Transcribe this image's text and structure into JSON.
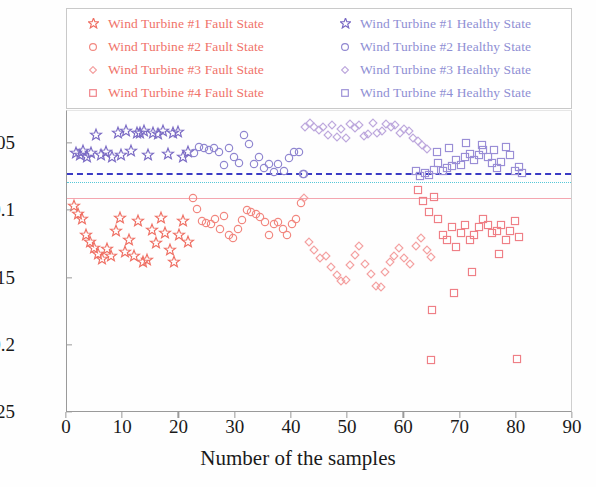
{
  "legend": {
    "entries": [
      {
        "label": "Wind Turbine #1  Fault State",
        "marker": "star",
        "color": "#ef6f63",
        "group": "fault"
      },
      {
        "label": "Wind Turbine #2  Fault State",
        "marker": "circle",
        "color": "#f2877f",
        "group": "fault"
      },
      {
        "label": "Wind Turbine #3  Fault State",
        "marker": "diamond",
        "color": "#f4a0a0",
        "group": "fault"
      },
      {
        "label": "Wind Turbine #4  Fault State",
        "marker": "square",
        "color": "#ef7f86",
        "group": "fault"
      },
      {
        "label": "Wind Turbine #1 Healthy State",
        "marker": "star",
        "color": "#7a6ac4",
        "group": "healthy"
      },
      {
        "label": "Wind Turbine #2 Healthy State",
        "marker": "circle",
        "color": "#8f86d0",
        "group": "healthy"
      },
      {
        "label": "Wind Turbine #3 Healthy State",
        "marker": "diamond",
        "color": "#bda8dd",
        "group": "healthy"
      },
      {
        "label": "Wind Turbine #4 Healthy State",
        "marker": "square",
        "color": "#9a8ed6",
        "group": "healthy"
      }
    ]
  },
  "chart_data": {
    "type": "scatter",
    "title": "",
    "xlabel": "Number of the samples",
    "ylabel": "",
    "xlim": [
      0,
      90
    ],
    "ylim": [
      -0.25,
      -0.0255
    ],
    "xticks": [
      0,
      10,
      20,
      30,
      40,
      50,
      60,
      70,
      80,
      90
    ],
    "xtick_labels": [
      "0",
      "10",
      "20",
      "30",
      "40",
      "50",
      "60",
      "70",
      "80",
      "90"
    ],
    "yticks": [
      -0.05,
      -0.1,
      -0.15,
      -0.2,
      -0.25
    ],
    "ytick_labels": [
      "-0.05",
      "-0.1",
      "-0.15",
      "-0.2",
      "-0.25"
    ],
    "grid": false,
    "legend_position": "top",
    "threshold_lines": [
      {
        "name": "blue-dashed-threshold",
        "y": -0.0718,
        "style": "dashed",
        "color": "#3b3bc4"
      },
      {
        "name": "cyan-dotted-threshold",
        "y": -0.0783,
        "style": "dotted",
        "color": "#55c8d8"
      },
      {
        "name": "pink-solid-threshold",
        "y": -0.0902,
        "style": "solid",
        "color": "#f4a6b0"
      }
    ],
    "series": [
      {
        "name": "Wind Turbine #1 Healthy State",
        "marker": "star",
        "color": "#7a6ac4",
        "points": [
          [
            1.6,
            -0.0565
          ],
          [
            2.3,
            -0.0585
          ],
          [
            2.9,
            -0.0555
          ],
          [
            3.6,
            -0.06
          ],
          [
            4.3,
            -0.0565
          ],
          [
            5.2,
            -0.043
          ],
          [
            6.1,
            -0.0585
          ],
          [
            7.0,
            -0.056
          ],
          [
            8.0,
            -0.06
          ],
          [
            9.0,
            -0.042
          ],
          [
            9.6,
            -0.0585
          ],
          [
            10.5,
            -0.04
          ],
          [
            11.3,
            -0.0555
          ],
          [
            12.4,
            -0.0415
          ],
          [
            13.0,
            -0.042
          ],
          [
            13.6,
            -0.0405
          ],
          [
            14.4,
            -0.0585
          ],
          [
            15.3,
            -0.0415
          ],
          [
            16.2,
            -0.0425
          ],
          [
            17.1,
            -0.0405
          ],
          [
            18.0,
            -0.0575
          ],
          [
            18.9,
            -0.042
          ],
          [
            19.8,
            -0.041
          ],
          [
            20.7,
            -0.06
          ],
          [
            21.6,
            -0.056
          ]
        ]
      },
      {
        "name": "Wind Turbine #1 Fault State",
        "marker": "star",
        "color": "#ef6f63",
        "points": [
          [
            1.2,
            -0.096
          ],
          [
            1.9,
            -0.102
          ],
          [
            2.6,
            -0.1055
          ],
          [
            3.3,
            -0.1175
          ],
          [
            4.0,
            -0.1225
          ],
          [
            4.8,
            -0.1275
          ],
          [
            5.5,
            -0.132
          ],
          [
            6.3,
            -0.1355
          ],
          [
            7.1,
            -0.128
          ],
          [
            7.9,
            -0.1335
          ],
          [
            8.7,
            -0.1145
          ],
          [
            9.5,
            -0.105
          ],
          [
            10.3,
            -0.13
          ],
          [
            11.1,
            -0.1215
          ],
          [
            11.9,
            -0.133
          ],
          [
            12.7,
            -0.107
          ],
          [
            13.5,
            -0.1375
          ],
          [
            14.3,
            -0.136
          ],
          [
            15.1,
            -0.114
          ],
          [
            15.9,
            -0.1235
          ],
          [
            16.7,
            -0.105
          ],
          [
            17.5,
            -0.1165
          ],
          [
            18.3,
            -0.129
          ],
          [
            19.1,
            -0.1375
          ],
          [
            19.9,
            -0.1175
          ],
          [
            20.7,
            -0.107
          ],
          [
            21.5,
            -0.123
          ]
        ]
      },
      {
        "name": "Wind Turbine #2 Healthy State",
        "marker": "circle",
        "color": "#8f86d0",
        "points": [
          [
            22.6,
            -0.0565
          ],
          [
            23.5,
            -0.052
          ],
          [
            24.4,
            -0.053
          ],
          [
            25.3,
            -0.0545
          ],
          [
            26.2,
            -0.053
          ],
          [
            27.0,
            -0.056
          ],
          [
            27.9,
            -0.0655
          ],
          [
            28.8,
            -0.053
          ],
          [
            29.7,
            -0.06
          ],
          [
            30.6,
            -0.064
          ],
          [
            31.4,
            -0.043
          ],
          [
            32.3,
            -0.05
          ],
          [
            33.2,
            -0.065
          ],
          [
            34.1,
            -0.06
          ],
          [
            35.0,
            -0.068
          ],
          [
            35.9,
            -0.065
          ],
          [
            36.8,
            -0.0705
          ],
          [
            37.6,
            -0.0645
          ],
          [
            38.5,
            -0.07
          ],
          [
            39.4,
            -0.0605
          ],
          [
            40.3,
            -0.056
          ],
          [
            41.2,
            -0.056
          ],
          [
            41.9,
            -0.072
          ],
          [
            42.1,
            -0.0725
          ]
        ]
      },
      {
        "name": "Wind Turbine #2 Fault State",
        "marker": "circle",
        "color": "#f2877f",
        "points": [
          [
            22.4,
            -0.0905
          ],
          [
            23.2,
            -0.0985
          ],
          [
            24.0,
            -0.107
          ],
          [
            24.8,
            -0.109
          ],
          [
            25.6,
            -0.1095
          ],
          [
            26.4,
            -0.1055
          ],
          [
            27.2,
            -0.113
          ],
          [
            28.0,
            -0.1035
          ],
          [
            28.8,
            -0.118
          ],
          [
            29.6,
            -0.12
          ],
          [
            30.4,
            -0.1135
          ],
          [
            31.2,
            -0.1065
          ],
          [
            32.0,
            -0.099
          ],
          [
            32.8,
            -0.1005
          ],
          [
            33.6,
            -0.102
          ],
          [
            34.4,
            -0.1045
          ],
          [
            35.2,
            -0.108
          ],
          [
            36.0,
            -0.1175
          ],
          [
            36.8,
            -0.1095
          ],
          [
            37.6,
            -0.108
          ],
          [
            38.4,
            -0.1135
          ],
          [
            39.2,
            -0.1175
          ],
          [
            40.0,
            -0.1095
          ],
          [
            40.8,
            -0.106
          ],
          [
            41.6,
            -0.0935
          ]
        ]
      },
      {
        "name": "Wind Turbine #3 Healthy State",
        "marker": "diamond",
        "color": "#bda8dd",
        "points": [
          [
            42.4,
            -0.0375
          ],
          [
            43.2,
            -0.0345
          ],
          [
            44.0,
            -0.037
          ],
          [
            44.8,
            -0.0395
          ],
          [
            45.6,
            -0.037
          ],
          [
            46.4,
            -0.043
          ],
          [
            47.2,
            -0.0355
          ],
          [
            48.0,
            -0.0445
          ],
          [
            48.8,
            -0.0385
          ],
          [
            49.6,
            -0.0455
          ],
          [
            50.4,
            -0.035
          ],
          [
            51.2,
            -0.038
          ],
          [
            52.0,
            -0.0355
          ],
          [
            52.8,
            -0.044
          ],
          [
            53.6,
            -0.0425
          ],
          [
            54.4,
            -0.0345
          ],
          [
            55.2,
            -0.042
          ],
          [
            56.0,
            -0.04
          ],
          [
            56.8,
            -0.035
          ],
          [
            57.6,
            -0.0375
          ],
          [
            58.4,
            -0.0355
          ],
          [
            59.2,
            -0.042
          ],
          [
            60.0,
            -0.039
          ],
          [
            60.8,
            -0.04
          ],
          [
            61.6,
            -0.0455
          ],
          [
            62.4,
            -0.0475
          ],
          [
            63.2,
            -0.0505
          ],
          [
            64.0,
            -0.0535
          ]
        ]
      },
      {
        "name": "Wind Turbine #3 Fault State",
        "marker": "diamond",
        "color": "#f4a0a0",
        "points": [
          [
            42.2,
            -0.09
          ],
          [
            43.0,
            -0.123
          ],
          [
            44.0,
            -0.129
          ],
          [
            45.0,
            -0.1345
          ],
          [
            46.0,
            -0.133
          ],
          [
            47.0,
            -0.1415
          ],
          [
            48.0,
            -0.1475
          ],
          [
            48.8,
            -0.152
          ],
          [
            49.6,
            -0.151
          ],
          [
            50.4,
            -0.14
          ],
          [
            51.2,
            -0.1325
          ],
          [
            52.0,
            -0.126
          ],
          [
            53.0,
            -0.1395
          ],
          [
            54.0,
            -0.147
          ],
          [
            55.0,
            -0.1555
          ],
          [
            55.8,
            -0.156
          ],
          [
            56.6,
            -0.1455
          ],
          [
            57.4,
            -0.1375
          ],
          [
            58.2,
            -0.133
          ],
          [
            59.0,
            -0.127
          ],
          [
            60.0,
            -0.135
          ],
          [
            61.0,
            -0.1395
          ],
          [
            62.0,
            -0.1255
          ],
          [
            63.0,
            -0.12
          ],
          [
            64.0,
            -0.1285
          ],
          [
            64.8,
            -0.134
          ]
        ]
      },
      {
        "name": "Wind Turbine #4 Healthy State",
        "marker": "square",
        "color": "#9a8ed6",
        "points": [
          [
            62.0,
            -0.07
          ],
          [
            62.8,
            -0.074
          ],
          [
            63.6,
            -0.0715
          ],
          [
            64.4,
            -0.073
          ],
          [
            65.2,
            -0.069
          ],
          [
            66.0,
            -0.064
          ],
          [
            66.8,
            -0.07
          ],
          [
            67.6,
            -0.068
          ],
          [
            68.4,
            -0.0665
          ],
          [
            69.2,
            -0.062
          ],
          [
            70.0,
            -0.0655
          ],
          [
            70.8,
            -0.06
          ],
          [
            71.6,
            -0.0575
          ],
          [
            72.4,
            -0.062
          ],
          [
            73.2,
            -0.0585
          ],
          [
            74.0,
            -0.0545
          ],
          [
            74.8,
            -0.06
          ],
          [
            75.6,
            -0.064
          ],
          [
            76.4,
            -0.068
          ],
          [
            77.2,
            -0.0635
          ],
          [
            78.0,
            -0.052
          ],
          [
            78.8,
            -0.0585
          ],
          [
            79.6,
            -0.07
          ],
          [
            80.4,
            -0.067
          ],
          [
            81.0,
            -0.0715
          ],
          [
            65.8,
            -0.056
          ],
          [
            68.0,
            -0.053
          ],
          [
            71.0,
            -0.0495
          ],
          [
            73.8,
            -0.0505
          ],
          [
            76.0,
            -0.0545
          ]
        ]
      },
      {
        "name": "Wind Turbine #4 Fault State",
        "marker": "square",
        "color": "#ef7f86",
        "points": [
          [
            62.4,
            -0.084
          ],
          [
            63.4,
            -0.0925
          ],
          [
            64.4,
            -0.1005
          ],
          [
            65.2,
            -0.0895
          ],
          [
            66.0,
            -0.1055
          ],
          [
            66.8,
            -0.1175
          ],
          [
            67.6,
            -0.121
          ],
          [
            68.4,
            -0.112
          ],
          [
            69.2,
            -0.1265
          ],
          [
            70.0,
            -0.116
          ],
          [
            70.8,
            -0.1105
          ],
          [
            71.6,
            -0.1215
          ],
          [
            72.4,
            -0.118
          ],
          [
            73.2,
            -0.1115
          ],
          [
            74.0,
            -0.106
          ],
          [
            74.8,
            -0.1105
          ],
          [
            75.6,
            -0.116
          ],
          [
            76.4,
            -0.1145
          ],
          [
            77.2,
            -0.11
          ],
          [
            78.0,
            -0.121
          ],
          [
            78.8,
            -0.115
          ],
          [
            79.6,
            -0.107
          ],
          [
            80.4,
            -0.119
          ],
          [
            65.0,
            -0.1735
          ],
          [
            68.8,
            -0.1605
          ],
          [
            64.8,
            -0.2105
          ],
          [
            80.0,
            -0.2095
          ],
          [
            72.0,
            -0.1455
          ],
          [
            76.8,
            -0.132
          ]
        ]
      }
    ]
  }
}
